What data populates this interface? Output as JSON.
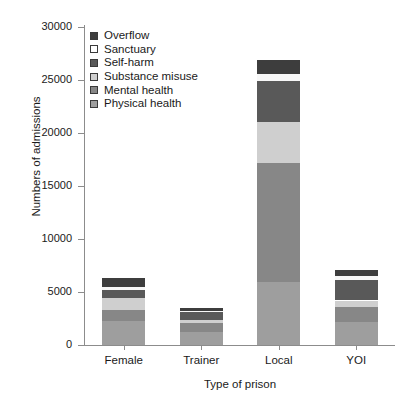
{
  "chart_data": {
    "type": "bar",
    "stacked": true,
    "title": "",
    "xlabel": "Type of prison",
    "ylabel": "Numbers of admissions",
    "categories": [
      "Female",
      "Trainer",
      "Local",
      "YOI"
    ],
    "ylim": [
      0,
      30000
    ],
    "yticks": [
      0,
      5000,
      10000,
      15000,
      20000,
      25000,
      30000
    ],
    "ytick_labels": [
      "0",
      "5000",
      "10000",
      "15000",
      "20000",
      "25000",
      "30000"
    ],
    "grid": false,
    "legend_position": "upper-left-inside",
    "series": [
      {
        "name": "Physical health",
        "color": "#9e9e9e",
        "values": [
          2300,
          1250,
          5950,
          2150
        ]
      },
      {
        "name": "Mental health",
        "color": "#878787",
        "values": [
          1000,
          800,
          11200,
          1400
        ]
      },
      {
        "name": "Substance misuse",
        "color": "#cfcfcf",
        "values": [
          1100,
          350,
          3850,
          650
        ]
      },
      {
        "name": "Self-harm",
        "color": "#595959",
        "values": [
          800,
          700,
          3900,
          1900
        ]
      },
      {
        "name": "Sanctuary",
        "color": "#f7f7f7",
        "values": [
          250,
          100,
          650,
          400
        ]
      },
      {
        "name": "Overflow",
        "color": "#3d3d3d",
        "values": [
          850,
          300,
          1300,
          600
        ]
      }
    ],
    "totals": [
      6300,
      3500,
      26850,
      7100
    ]
  },
  "legend": {
    "entries": [
      {
        "label": "Overflow",
        "color": "#3d3d3d"
      },
      {
        "label": "Sanctuary",
        "color": "#ffffff"
      },
      {
        "label": "Self-harm",
        "color": "#595959"
      },
      {
        "label": "Substance misuse",
        "color": "#cfcfcf"
      },
      {
        "label": "Mental health",
        "color": "#878787"
      },
      {
        "label": "Physical health",
        "color": "#9e9e9e"
      }
    ]
  }
}
